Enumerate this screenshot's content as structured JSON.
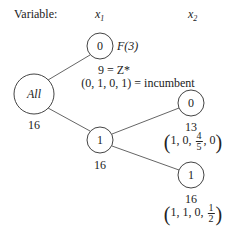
{
  "header": {
    "variable_label": "Variable:",
    "columns": [
      {
        "var": "x",
        "sub": "1"
      },
      {
        "var": "x",
        "sub": "2"
      }
    ]
  },
  "nodes": {
    "root": {
      "label": "All",
      "bound": "16"
    },
    "x1_0": {
      "label": "0",
      "status": "F(3)",
      "z_line": "9 = Z*",
      "incumbent_line": "(0, 1, 0, 1) = incumbent"
    },
    "x1_1": {
      "label": "1",
      "bound": "16"
    },
    "x2_0": {
      "label": "0",
      "bound": "13",
      "solution": {
        "pre": "1, 0,",
        "frac_num": "4",
        "frac_den": "5",
        "post": ", 0"
      }
    },
    "x2_1": {
      "label": "1",
      "bound": "16",
      "solution": {
        "pre": "1, 1, 0,",
        "frac_num": "1",
        "frac_den": "2",
        "post": ""
      }
    }
  },
  "colors": {
    "line": "#555555",
    "text": "#222222"
  }
}
